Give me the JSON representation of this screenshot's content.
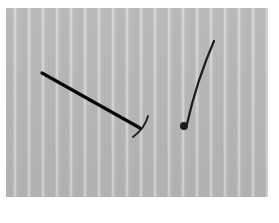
{
  "scene": {
    "description": "Two dark slender objects on a gray vertically striped background",
    "background_color": "#b9b9b9",
    "stripe_color": "#d4d4d4",
    "border_color": "#ffffff",
    "objects": [
      {
        "name": "pickaxe-shaped-object",
        "color": "#111111"
      },
      {
        "name": "pin-with-round-head",
        "color": "#1a1a1a"
      }
    ]
  }
}
